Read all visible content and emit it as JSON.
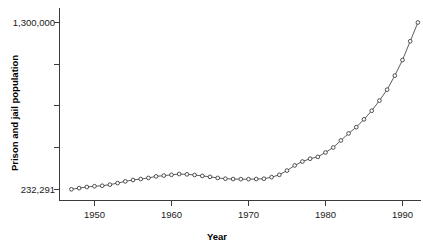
{
  "chart_data": {
    "type": "line",
    "title": "",
    "xlabel": "Year",
    "ylabel": "Prison and jail population",
    "xlim": [
      1946.5,
      1992.5
    ],
    "ylim": [
      232291,
      1300000
    ],
    "grid": false,
    "legend": null,
    "marker": "open-circle",
    "y_tick_labels": [
      "1,300,000",
      "232,291"
    ],
    "y_tick_values": [
      1300000,
      232291
    ],
    "y_unlabeled_tick_count": 3,
    "x_tick_labels": [
      "1950",
      "1960",
      "1970",
      "1980",
      "1990"
    ],
    "x_tick_values": [
      1950,
      1960,
      1970,
      1980,
      1990
    ],
    "x": [
      1947,
      1948,
      1949,
      1950,
      1951,
      1952,
      1953,
      1954,
      1955,
      1956,
      1957,
      1958,
      1959,
      1960,
      1961,
      1962,
      1963,
      1964,
      1965,
      1966,
      1967,
      1968,
      1969,
      1970,
      1971,
      1972,
      1973,
      1974,
      1975,
      1976,
      1977,
      1978,
      1979,
      1980,
      1981,
      1982,
      1983,
      1984,
      1985,
      1986,
      1987,
      1988,
      1989,
      1990,
      1991,
      1992
    ],
    "values": [
      232291,
      240000,
      247000,
      252000,
      255000,
      262000,
      272000,
      283000,
      292000,
      298000,
      305000,
      315000,
      320000,
      325000,
      330000,
      328000,
      324000,
      318000,
      312000,
      305000,
      300000,
      298000,
      297000,
      297000,
      298000,
      300000,
      310000,
      325000,
      352000,
      385000,
      410000,
      428000,
      440000,
      468000,
      500000,
      545000,
      590000,
      630000,
      680000,
      735000,
      800000,
      870000,
      960000,
      1060000,
      1180000,
      1300000
    ]
  },
  "y_axis": {
    "top_label": "1,300,000",
    "bottom_label": "232,291",
    "title": "Prison and jail population"
  },
  "x_axis": {
    "title": "Year",
    "labels": [
      "1950",
      "1960",
      "1970",
      "1980",
      "1990"
    ]
  },
  "colors": {
    "line": "#4a4a4a",
    "marker_fill": "#ffffff",
    "marker_stroke": "#333333",
    "axis": "#3b3b3b",
    "text": "#1a1a1a",
    "background": "#ffffff"
  }
}
